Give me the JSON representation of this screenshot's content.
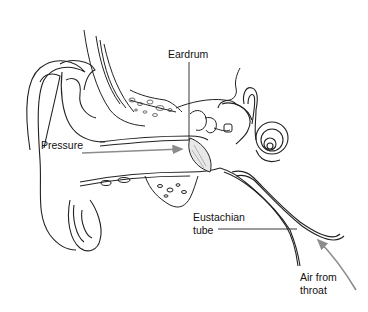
{
  "diagram": {
    "labels": {
      "eardrum": "Eardrum",
      "pressure": "Pressure",
      "eustachian_line1": "Eustachian",
      "eustachian_line2": "tube",
      "air_line1": "Air from",
      "air_line2": "throat"
    },
    "colors": {
      "line": "#222222",
      "arrow": "#8c8c8c",
      "background": "#ffffff"
    }
  }
}
